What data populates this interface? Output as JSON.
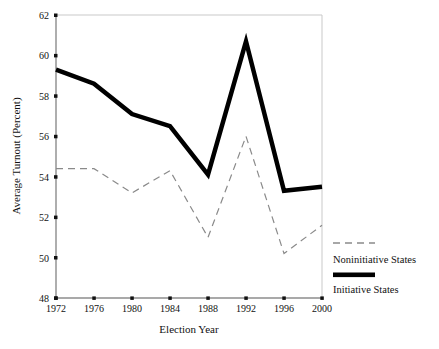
{
  "chart_data": {
    "type": "line",
    "title": "",
    "xlabel": "Election Year",
    "ylabel": "Average Turnout (Percent)",
    "categories": [
      "1972",
      "1976",
      "1980",
      "1984",
      "1988",
      "1992",
      "1996",
      "2000"
    ],
    "x": [
      1972,
      1976,
      1980,
      1984,
      1988,
      1992,
      1996,
      2000
    ],
    "xlim": [
      1972,
      2000
    ],
    "ylim": [
      48,
      62
    ],
    "yticks": [
      48,
      50,
      52,
      54,
      56,
      58,
      60,
      62
    ],
    "ytick_labels": [
      "48",
      "50",
      "52",
      "54",
      "56",
      "58",
      "60",
      "62"
    ],
    "xticks": [
      1972,
      1976,
      1980,
      1984,
      1988,
      1992,
      1996,
      2000
    ],
    "xtick_labels": [
      "1972",
      "1976",
      "1980",
      "1984",
      "1988",
      "1992",
      "1996",
      "2000"
    ],
    "grid": false,
    "legend_position": "right",
    "series": [
      {
        "name": "Noninitiative States",
        "style": "dashed",
        "color": "#8a8a8a",
        "line_width": 1.2,
        "values": [
          54.4,
          54.4,
          53.2,
          54.3,
          51.0,
          56.0,
          50.2,
          51.6
        ]
      },
      {
        "name": "Initiative States",
        "style": "solid",
        "color": "#000000",
        "line_width": 4.5,
        "values": [
          59.3,
          58.6,
          57.1,
          56.5,
          54.1,
          60.7,
          53.3,
          53.5
        ]
      }
    ]
  },
  "legend": {
    "items": [
      {
        "label": "Noninitiative States",
        "swatch": "dashed-line-swatch"
      },
      {
        "label": "Initiative States",
        "swatch": "solid-thick-line-swatch"
      }
    ]
  },
  "axes": {
    "y_title": "Average Turnout (Percent)",
    "x_title": "Election Year"
  },
  "colors": {
    "initiative": "#000000",
    "noninitiative": "#8a8a8a",
    "axis": "#999999",
    "text": "#111111",
    "background": "#ffffff"
  }
}
